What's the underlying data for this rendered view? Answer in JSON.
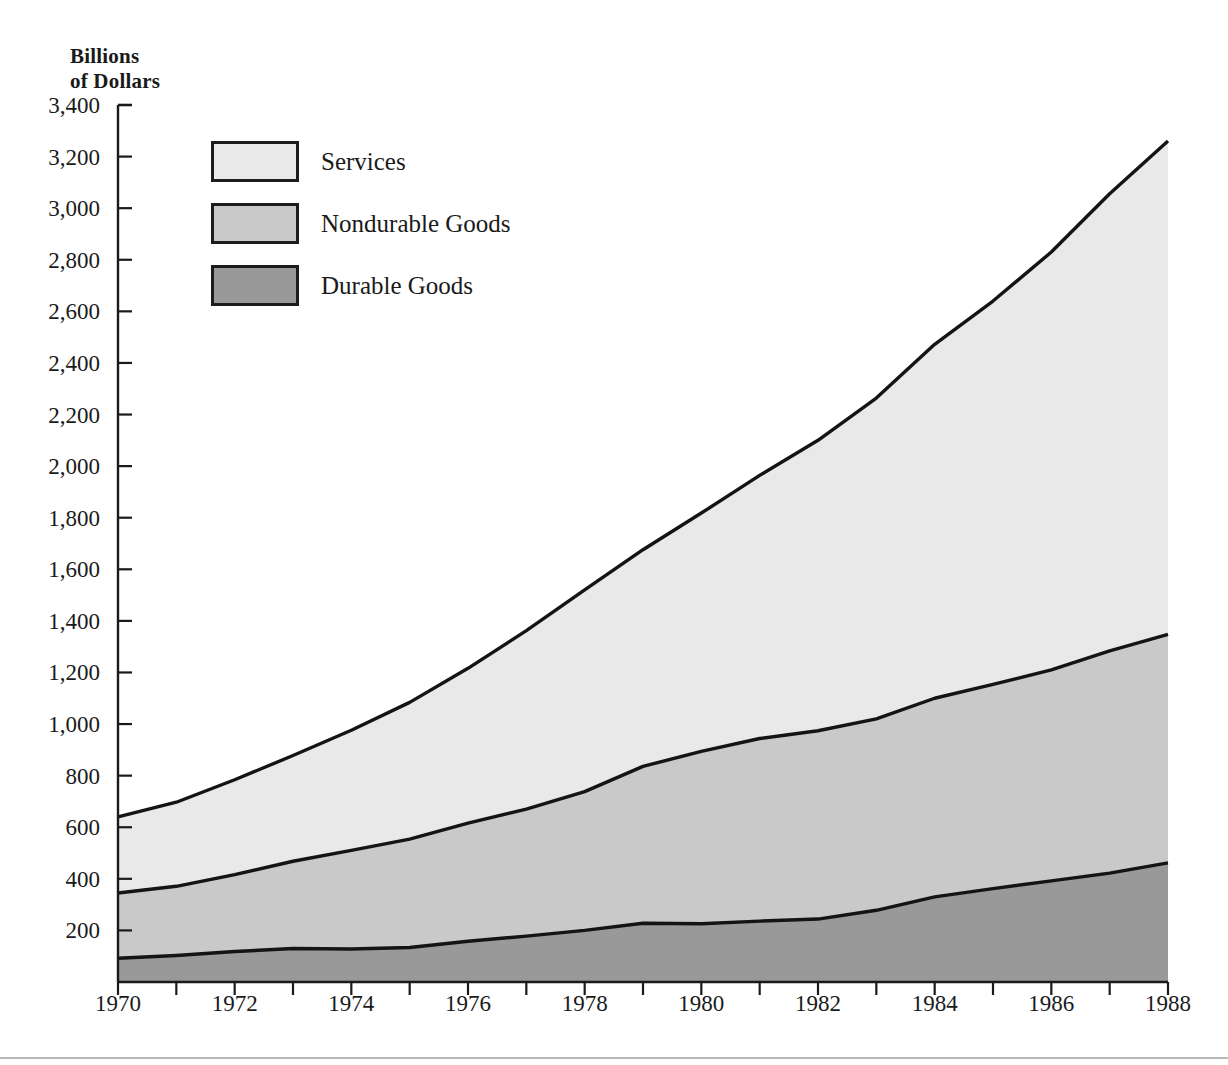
{
  "axis_title": "Billions\nof Dollars",
  "legend": {
    "position": "inside-top-left",
    "items": [
      {
        "label": "Services",
        "color": "#e9e9e9",
        "name": "services"
      },
      {
        "label": "Nondurable Goods",
        "color": "#c9c9c9",
        "name": "nondurable-goods"
      },
      {
        "label": "Durable Goods",
        "color": "#999999",
        "name": "durable-goods"
      }
    ]
  },
  "chart_data": {
    "type": "area",
    "stacked": true,
    "title": "",
    "subtitle": "",
    "xlabel": "",
    "ylabel": "Billions of Dollars",
    "grid": false,
    "legend_position": "inside-top-left",
    "xlim": [
      1970,
      1988
    ],
    "ylim": [
      0,
      3400
    ],
    "x": [
      1970,
      1971,
      1972,
      1973,
      1974,
      1975,
      1976,
      1977,
      1978,
      1979,
      1980,
      1981,
      1982,
      1983,
      1984,
      1985,
      1986,
      1987,
      1988
    ],
    "xticks": [
      1970,
      1972,
      1974,
      1976,
      1978,
      1980,
      1982,
      1984,
      1986,
      1988
    ],
    "xtick_labels": [
      "1970",
      "1972",
      "1974",
      "1976",
      "1978",
      "1980",
      "1982",
      "1984",
      "1986",
      "1988"
    ],
    "xminor_ticks": [
      1971,
      1973,
      1975,
      1977,
      1979,
      1981,
      1983,
      1985,
      1987
    ],
    "yticks": [
      200,
      400,
      600,
      800,
      1000,
      1200,
      1400,
      1600,
      1800,
      2000,
      2200,
      2400,
      2600,
      2800,
      3000,
      3200,
      3400
    ],
    "ytick_labels": [
      "200",
      "400",
      "600",
      "800",
      "1,000",
      "1,200",
      "1,400",
      "1,600",
      "1,800",
      "2,000",
      "2,200",
      "2,400",
      "2,600",
      "2,800",
      "3,000",
      "3,200",
      "3,400"
    ],
    "series": [
      {
        "name": "Durable Goods",
        "color": "#999999",
        "values": [
          92,
          103,
          118,
          130,
          128,
          134,
          158,
          178,
          200,
          228,
          226,
          236,
          244,
          278,
          330,
          362,
          392,
          422,
          462
        ]
      },
      {
        "name": "Nondurable Goods",
        "color": "#c9c9c9",
        "values": [
          253,
          268,
          298,
          338,
          382,
          420,
          458,
          492,
          538,
          608,
          668,
          708,
          730,
          742,
          770,
          792,
          818,
          862,
          886
        ]
      },
      {
        "name": "Services",
        "color": "#e9e9e9",
        "values": [
          295,
          326,
          368,
          410,
          466,
          530,
          600,
          692,
          782,
          840,
          924,
          1020,
          1126,
          1244,
          1372,
          1486,
          1620,
          1772,
          1912
        ]
      }
    ],
    "stack_tops": {
      "Durable Goods": [
        92,
        103,
        118,
        130,
        128,
        134,
        158,
        178,
        200,
        228,
        226,
        236,
        244,
        278,
        330,
        362,
        392,
        422,
        462
      ],
      "Nondurable Goods": [
        345,
        371,
        416,
        468,
        510,
        554,
        616,
        670,
        738,
        836,
        894,
        944,
        974,
        1020,
        1100,
        1154,
        1210,
        1284,
        1348
      ],
      "Total": [
        640,
        697,
        784,
        878,
        976,
        1084,
        1216,
        1362,
        1520,
        1676,
        1818,
        1964,
        2100,
        2264,
        2472,
        2640,
        2830,
        3056,
        3260
      ]
    }
  }
}
